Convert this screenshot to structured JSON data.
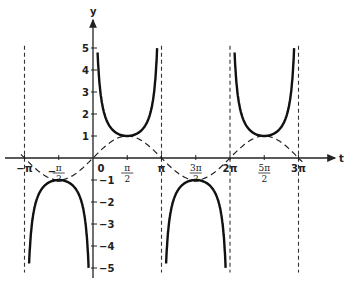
{
  "chart_data": {
    "type": "line",
    "title": "",
    "xlabel": "t",
    "ylabel": "y",
    "xlim": [
      -3.4,
      9.9
    ],
    "ylim": [
      -5,
      5
    ],
    "x_ticks": [
      {
        "value": -3.14159,
        "label": "−π"
      },
      {
        "value": -1.5708,
        "label": "−π/2"
      },
      {
        "value": 0,
        "label": "0"
      },
      {
        "value": 1.5708,
        "label": "π/2"
      },
      {
        "value": 3.14159,
        "label": "π"
      },
      {
        "value": 4.71239,
        "label": "3π/2"
      },
      {
        "value": 6.28319,
        "label": "2π"
      },
      {
        "value": 7.85398,
        "label": "5π/2"
      },
      {
        "value": 9.42478,
        "label": "3π"
      }
    ],
    "y_ticks": [
      5,
      4,
      3,
      2,
      1,
      -1,
      -2,
      -3,
      -4,
      -5
    ],
    "series": [
      {
        "name": "y = csc t",
        "style": "solid-thick",
        "description": "cosecant branches between asymptotes"
      },
      {
        "name": "y = sin t",
        "style": "dashed",
        "description": "sine curve"
      }
    ],
    "asymptotes": [
      -3.14159,
      0,
      3.14159,
      6.28319,
      9.42478
    ],
    "grid": false,
    "legend": "none"
  },
  "axes": {
    "x_label": "t",
    "y_label": "y",
    "origin_label": "0"
  }
}
